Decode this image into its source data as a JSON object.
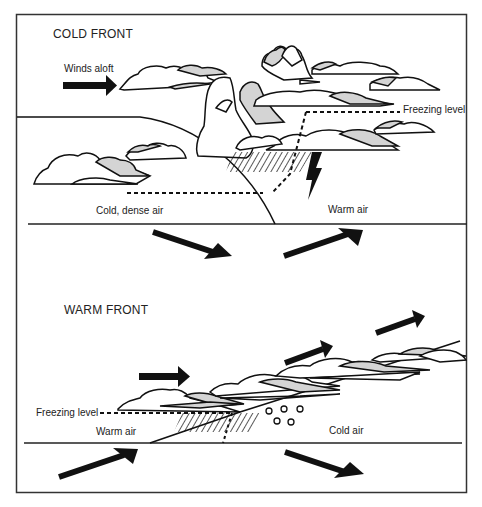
{
  "diagram": {
    "panels": [
      {
        "title": "COLD FRONT",
        "labels": {
          "winds_aloft": "Winds aloft",
          "freezing_level": "Freezing level",
          "cold_air": "Cold, dense air",
          "warm_air": "Warm air"
        }
      },
      {
        "title": "WARM FRONT",
        "labels": {
          "freezing_level": "Freezing level",
          "warm_air": "Warm air",
          "cold_air": "Cold air"
        }
      }
    ],
    "colors": {
      "line": "#111111",
      "cloud_fill": "#ffffff",
      "cloud_shade": "#d4d4d4",
      "frame": "#333333"
    }
  }
}
